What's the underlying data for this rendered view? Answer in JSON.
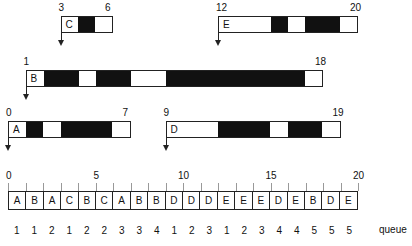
{
  "processes": [
    {
      "name": "C",
      "start": 3,
      "end": 6,
      "start_label": "3",
      "end_label": "6",
      "segments": [
        {
          "from": 3,
          "to": 4,
          "state": "wait"
        },
        {
          "from": 4,
          "to": 5,
          "state": "run"
        },
        {
          "from": 5,
          "to": 6,
          "state": "wait"
        }
      ]
    },
    {
      "name": "E",
      "start": 12,
      "end": 20,
      "start_label": "12",
      "end_label": "20",
      "segments": [
        {
          "from": 12,
          "to": 15,
          "state": "wait"
        },
        {
          "from": 15,
          "to": 16,
          "state": "run"
        },
        {
          "from": 16,
          "to": 17,
          "state": "wait"
        },
        {
          "from": 17,
          "to": 19,
          "state": "run"
        },
        {
          "from": 19,
          "to": 20,
          "state": "wait"
        }
      ]
    },
    {
      "name": "B",
      "start": 1,
      "end": 18,
      "start_label": "1",
      "end_label": "18",
      "segments": [
        {
          "from": 1,
          "to": 2,
          "state": "wait"
        },
        {
          "from": 2,
          "to": 4,
          "state": "run"
        },
        {
          "from": 4,
          "to": 5,
          "state": "wait"
        },
        {
          "from": 5,
          "to": 7,
          "state": "run"
        },
        {
          "from": 7,
          "to": 9,
          "state": "wait"
        },
        {
          "from": 9,
          "to": 17,
          "state": "run"
        },
        {
          "from": 17,
          "to": 18,
          "state": "wait"
        }
      ]
    },
    {
      "name": "A",
      "start": 0,
      "end": 7,
      "start_label": "0",
      "end_label": "7",
      "segments": [
        {
          "from": 0,
          "to": 1,
          "state": "wait"
        },
        {
          "from": 1,
          "to": 2,
          "state": "run"
        },
        {
          "from": 2,
          "to": 3,
          "state": "wait"
        },
        {
          "from": 3,
          "to": 6,
          "state": "run"
        },
        {
          "from": 6,
          "to": 7,
          "state": "wait"
        }
      ]
    },
    {
      "name": "D",
      "start": 9,
      "end": 19,
      "start_label": "9",
      "end_label": "19",
      "segments": [
        {
          "from": 9,
          "to": 12,
          "state": "wait"
        },
        {
          "from": 12,
          "to": 15,
          "state": "run"
        },
        {
          "from": 15,
          "to": 16,
          "state": "wait"
        },
        {
          "from": 16,
          "to": 18,
          "state": "run"
        },
        {
          "from": 18,
          "to": 19,
          "state": "wait"
        }
      ]
    }
  ],
  "timeline": {
    "tick_labels": [
      "0",
      "5",
      "10",
      "15",
      "20"
    ],
    "cells": [
      "A",
      "B",
      "A",
      "C",
      "B",
      "C",
      "A",
      "B",
      "B",
      "D",
      "D",
      "D",
      "E",
      "E",
      "E",
      "D",
      "E",
      "B",
      "D",
      "E"
    ],
    "queue_values": [
      "1",
      "1",
      "2",
      "1",
      "2",
      "2",
      "3",
      "3",
      "4",
      "1",
      "2",
      "3",
      "1",
      "2",
      "3",
      "4",
      "4",
      "5",
      "5",
      "5"
    ],
    "queue_label": "queue"
  },
  "colors": {
    "run": "#111111",
    "wait": "#ffffff",
    "line": "#222222"
  }
}
